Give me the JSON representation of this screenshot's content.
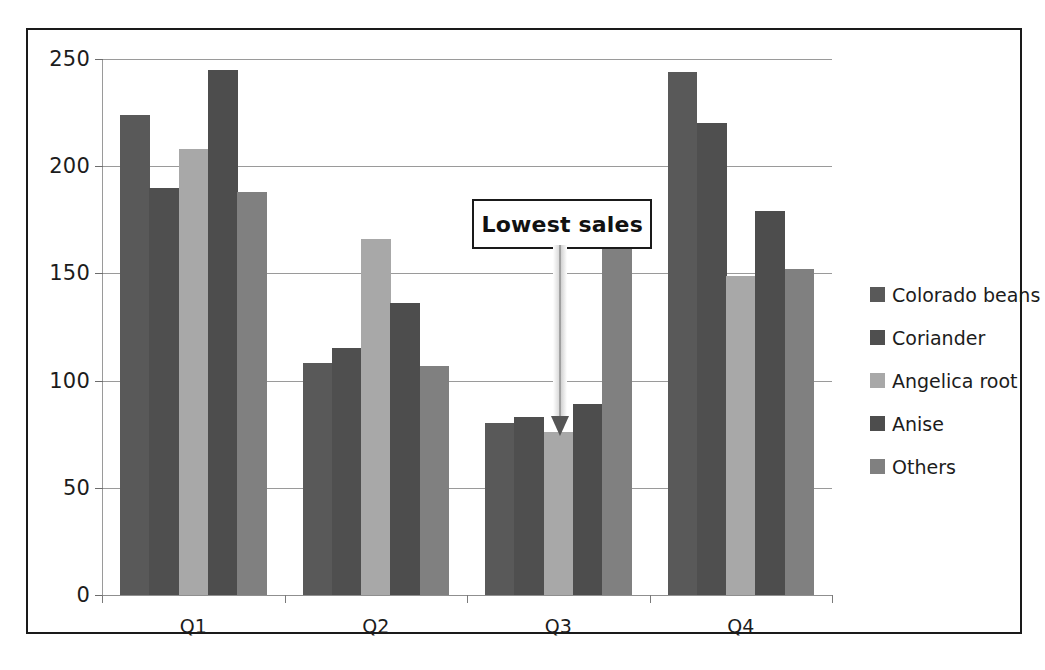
{
  "chart_data": {
    "type": "bar",
    "title": "",
    "xlabel": "",
    "ylabel": "",
    "categories": [
      "Q1",
      "Q2",
      "Q3",
      "Q4"
    ],
    "ylim": [
      0,
      250
    ],
    "yticks": [
      0,
      50,
      100,
      150,
      200,
      250
    ],
    "ytick_labels": [
      "0",
      "50",
      "100",
      "150",
      "200",
      "250"
    ],
    "grid": true,
    "legend_position": "right",
    "series": [
      {
        "name": "Colorado beans",
        "color": "#595959",
        "values": [
          224,
          108,
          80,
          244
        ]
      },
      {
        "name": "Coriander",
        "color": "#4f4f4f",
        "values": [
          190,
          115,
          83,
          220
        ]
      },
      {
        "name": "Angelica root",
        "color": "#a8a8a8",
        "values": [
          208,
          166,
          76,
          149
        ]
      },
      {
        "name": "Anise",
        "color": "#4d4d4d",
        "values": [
          245,
          136,
          89,
          179
        ]
      },
      {
        "name": "Others",
        "color": "#808080",
        "values": [
          188,
          107,
          164,
          152
        ]
      }
    ],
    "annotations": [
      {
        "text": "Lowest sales",
        "points_to_series": "Angelica root",
        "points_to_category": "Q3",
        "points_to_value": 76
      }
    ]
  },
  "figure": {
    "border_color": "#1a1a1a",
    "background": "#ffffff",
    "gridline_color": "#9a9a9a"
  }
}
